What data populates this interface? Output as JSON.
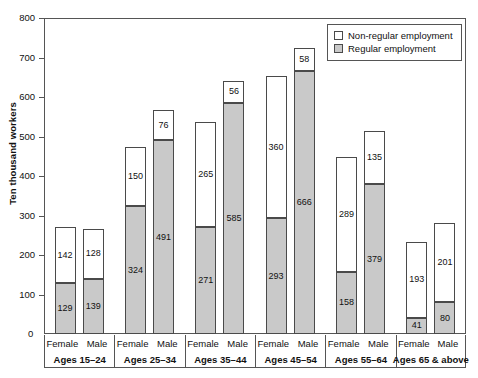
{
  "chart_data": {
    "type": "bar",
    "subtype": "stacked-grouped-vertical",
    "title": "",
    "xlabel": "",
    "ylabel": "Ten thousand workers",
    "ylim": [
      0,
      800
    ],
    "yticks": [
      0,
      100,
      200,
      300,
      400,
      500,
      600,
      700,
      800
    ],
    "ytick_labels": [
      "0",
      "100",
      "200",
      "300",
      "400",
      "500",
      "600",
      "700",
      "800"
    ],
    "grid": false,
    "legend_position": "top-right",
    "legend": [
      {
        "key": "nonregular",
        "label": "Non-regular employment",
        "color": "#ffffff"
      },
      {
        "key": "regular",
        "label": "Regular employment",
        "color": "#c9c9c9"
      }
    ],
    "series": [
      {
        "name": "Regular employment",
        "key": "regular",
        "values": [
          129,
          139,
          324,
          491,
          271,
          585,
          293,
          666,
          158,
          379,
          41,
          80
        ]
      },
      {
        "name": "Non-regular employment",
        "key": "nonregular",
        "values": [
          142,
          128,
          150,
          76,
          265,
          56,
          360,
          58,
          289,
          135,
          193,
          201
        ]
      }
    ],
    "categories": [
      "Ages 15-24 Female",
      "Ages 15-24 Male",
      "Ages 25-34 Female",
      "Ages 25-34 Male",
      "Ages 35-44 Female",
      "Ages 35-44 Male",
      "Ages 45-54 Female",
      "Ages 45-54 Male",
      "Ages 55-64 Female",
      "Ages 55-64 Male",
      "Ages 65 & above Female",
      "Ages 65 & above Male"
    ],
    "totals": [
      271,
      267,
      474,
      567,
      536,
      641,
      653,
      724,
      447,
      514,
      234,
      281
    ],
    "groups": [
      {
        "age": "Ages 15–24",
        "bars": [
          {
            "sex": "Female",
            "regular": 129,
            "nonregular": 142
          },
          {
            "sex": "Male",
            "regular": 139,
            "nonregular": 128
          }
        ]
      },
      {
        "age": "Ages 25–34",
        "bars": [
          {
            "sex": "Female",
            "regular": 324,
            "nonregular": 150
          },
          {
            "sex": "Male",
            "regular": 491,
            "nonregular": 76
          }
        ]
      },
      {
        "age": "Ages 35–44",
        "bars": [
          {
            "sex": "Female",
            "regular": 271,
            "nonregular": 265
          },
          {
            "sex": "Male",
            "regular": 585,
            "nonregular": 56
          }
        ]
      },
      {
        "age": "Ages 45–54",
        "bars": [
          {
            "sex": "Female",
            "regular": 293,
            "nonregular": 360
          },
          {
            "sex": "Male",
            "regular": 666,
            "nonregular": 58
          }
        ]
      },
      {
        "age": "Ages 55–64",
        "bars": [
          {
            "sex": "Female",
            "regular": 158,
            "nonregular": 289
          },
          {
            "sex": "Male",
            "regular": 379,
            "nonregular": 135
          }
        ]
      },
      {
        "age": "Ages 65 & above",
        "bars": [
          {
            "sex": "Female",
            "regular": 41,
            "nonregular": 193
          },
          {
            "sex": "Male",
            "regular": 80,
            "nonregular": 201
          }
        ]
      }
    ]
  },
  "colors": {
    "regular_fill": "#c9c9c9",
    "nonregular_fill": "#ffffff",
    "outline": "#4a4a4a",
    "axis": "#555555",
    "text": "#111111"
  }
}
